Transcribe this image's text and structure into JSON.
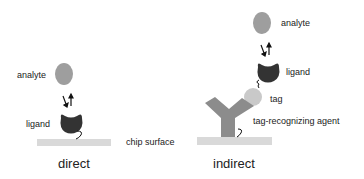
{
  "colors": {
    "analyte": "#9e9e9e",
    "ligand": "#333333",
    "tag": "#c9c9c9",
    "tag_recognizing_agent": "#8c8c8c",
    "chip_surface": "#d9d9d9",
    "text": "#222222"
  },
  "direct": {
    "title": "direct",
    "analyte_label": "analyte",
    "ligand_label": "ligand"
  },
  "indirect": {
    "title": "indirect",
    "analyte_label": "analyte",
    "ligand_label": "ligand",
    "tag_label": "tag",
    "agent_label": "tag-recognizing agent"
  },
  "shared": {
    "chip_surface_label": "chip surface"
  }
}
